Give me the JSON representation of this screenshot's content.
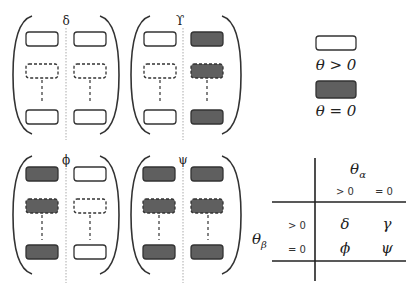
{
  "colors": {
    "positive": "#ffffff",
    "zero": "#5f5f5f",
    "stroke": "#333333",
    "divider": "#aaaaaa"
  },
  "matrices": [
    {
      "label": "δ",
      "left": "positive",
      "right": "positive"
    },
    {
      "label": "ϒ",
      "left": "positive",
      "right": "zero"
    },
    {
      "label": "ϕ",
      "left": "zero",
      "right": "positive"
    },
    {
      "label": "ψ",
      "left": "zero",
      "right": "zero"
    }
  ],
  "legend": {
    "positive_label": "θ > 0",
    "zero_label": "θ = 0"
  },
  "table": {
    "col_header": "θ",
    "col_sub": "α",
    "row_header": "θ",
    "row_sub": "β",
    "col_values": [
      "> 0",
      "= 0"
    ],
    "row_values": [
      "> 0",
      "= 0"
    ],
    "cells": [
      [
        "δ",
        "γ"
      ],
      [
        "ϕ",
        "ψ"
      ]
    ]
  }
}
